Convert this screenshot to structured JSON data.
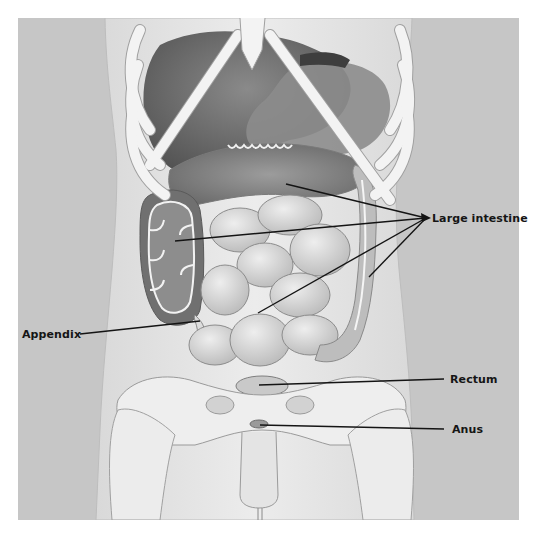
{
  "diagram": {
    "type": "anatomical-illustration",
    "colors": {
      "page_background": "#ffffff",
      "panel_background": "#c6c6c6",
      "body_silhouette": "#e2e2e2",
      "bone": "#f2f2f2",
      "bone_outline": "#9a9a9a",
      "organ_dark": "#6e6e6e",
      "organ_mid": "#a8a8a8",
      "intestine": "#cfcfcf",
      "leader_line": "#141414",
      "label_text": "#151515"
    },
    "labels": [
      {
        "id": "large-intestine",
        "text": "Large intestine",
        "position": {
          "x": 432,
          "y": 212
        },
        "leader_origin": {
          "x": 426,
          "y": 218
        },
        "leader_targets": [
          {
            "x": 286,
            "y": 184
          },
          {
            "x": 175,
            "y": 241
          },
          {
            "x": 258,
            "y": 313
          },
          {
            "x": 369,
            "y": 277
          }
        ],
        "arrowhead": true
      },
      {
        "id": "appendix",
        "text": "Appendix",
        "position": {
          "x": 22,
          "y": 328
        },
        "leader_origin": {
          "x": 80,
          "y": 334
        },
        "leader_targets": [
          {
            "x": 200,
            "y": 321
          }
        ],
        "arrowhead": false
      },
      {
        "id": "rectum",
        "text": "Rectum",
        "position": {
          "x": 450,
          "y": 373
        },
        "leader_origin": {
          "x": 444,
          "y": 379
        },
        "leader_targets": [
          {
            "x": 259,
            "y": 385
          }
        ],
        "arrowhead": false
      },
      {
        "id": "anus",
        "text": "Anus",
        "position": {
          "x": 452,
          "y": 423
        },
        "leader_origin": {
          "x": 444,
          "y": 429
        },
        "leader_targets": [
          {
            "x": 260,
            "y": 425
          }
        ],
        "arrowhead": false
      }
    ]
  }
}
